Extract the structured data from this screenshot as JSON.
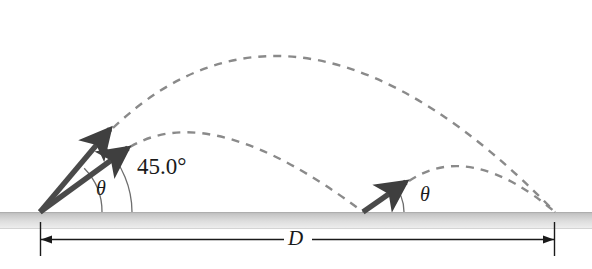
{
  "figure": {
    "labels": {
      "theta_left": "θ",
      "theta_right": "θ",
      "angle_45": "45.0°",
      "distance_d": "D"
    },
    "colors": {
      "background": "#ffffff",
      "trajectory": "#8a8a8a",
      "arrow": "#4d4d4d",
      "arrow_dark": "#3a3a3a",
      "ground_top": "#c4c4c4",
      "ground_bottom": "#ededed",
      "ground_edge": "#b0b0b0",
      "dimension_line": "#1a1a1a",
      "arc": "#6e6e6e",
      "text": "#1a1a1a"
    },
    "ground": {
      "x": 0,
      "y": 212,
      "width": 592,
      "height": 17
    },
    "launch_points": [
      {
        "name": "origin",
        "x": 40,
        "y": 212
      },
      {
        "name": "second-launch",
        "x": 363,
        "y": 212
      }
    ],
    "landing_point": {
      "x": 555,
      "y": 212
    },
    "velocity_arrows": [
      {
        "name": "steep-velocity-arrow",
        "x1": 40,
        "y1": 212,
        "x2": 113,
        "y2": 126
      },
      {
        "name": "shallow-velocity-arrow",
        "x1": 40,
        "y1": 212,
        "x2": 131,
        "y2": 145
      },
      {
        "name": "second-launch-velocity-arrow",
        "x1": 363,
        "y1": 212,
        "x2": 409,
        "y2": 180
      }
    ],
    "angle_arcs": [
      {
        "name": "theta-arc-left",
        "cx": 40,
        "cy": 212,
        "r": 62
      },
      {
        "name": "angle-45-arc-left",
        "cx": 40,
        "cy": 212,
        "r": 92
      },
      {
        "name": "theta-arc-right",
        "cx": 363,
        "cy": 212,
        "r": 41
      }
    ],
    "trajectories": [
      {
        "name": "high-trajectory",
        "description": "Steep launch parabola reaching apex near x=300",
        "start": {
          "x": 113,
          "y": 128
        },
        "apex": {
          "x": 300,
          "y": 18
        },
        "end": {
          "x": 555,
          "y": 212
        }
      },
      {
        "name": "low-trajectory",
        "description": "Shallow launch parabola landing at second launch point",
        "start": {
          "x": 130,
          "y": 147
        },
        "apex": {
          "x": 207,
          "y": 126
        },
        "end": {
          "x": 363,
          "y": 212
        }
      },
      {
        "name": "second-launch-trajectory",
        "description": "Short parabola from second launch point to landing point",
        "start": {
          "x": 409,
          "y": 181
        },
        "apex": {
          "x": 468,
          "y": 162
        },
        "end": {
          "x": 555,
          "y": 212
        }
      }
    ],
    "dimension": {
      "name": "range-dimension",
      "x1": 40,
      "x2": 555,
      "y": 239,
      "tick_top": 222,
      "tick_bottom": 256,
      "label": "D"
    }
  }
}
